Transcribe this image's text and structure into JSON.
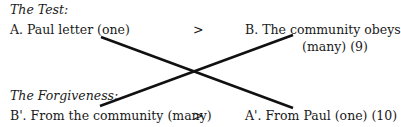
{
  "test": {
    "heading": "The Test:",
    "left": "A. Paul letter (one)",
    "relation": ">",
    "right_line1": "B. The community obeys",
    "right_line2": "(many) (9)"
  },
  "forgiveness": {
    "heading": "The Forgiveness:",
    "left": "B'. From the community (many)",
    "relation": ">",
    "right": "A'. From Paul (one) (10)"
  },
  "lines": [
    {
      "from": "A. Paul letter (one)",
      "to": "A'. From Paul (one) (10)"
    },
    {
      "from": "B'. From the community (many)",
      "to": "B. The community obeys"
    }
  ],
  "colors": {
    "line": "#111111",
    "text": "#1a1a1a"
  }
}
